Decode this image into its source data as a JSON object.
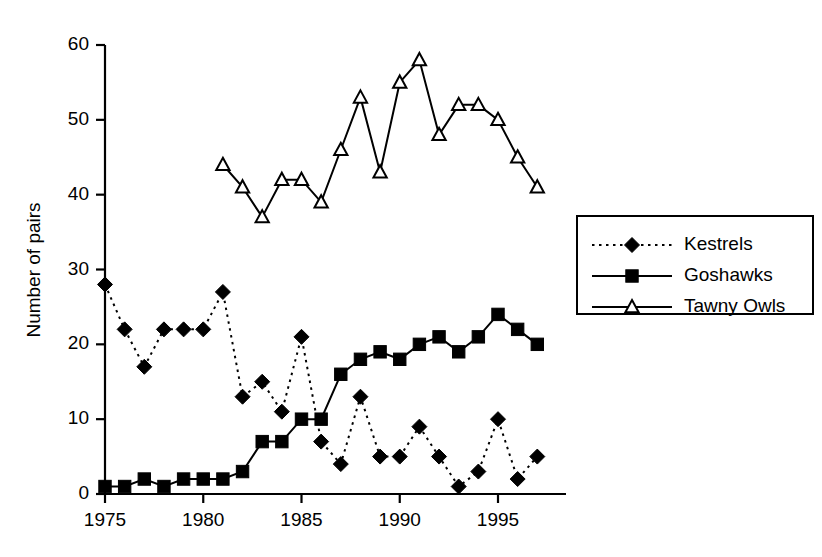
{
  "chart_data": {
    "type": "line",
    "title": "",
    "subtitle": "",
    "xlabel": "",
    "ylabel": "Number of pairs",
    "xlim": [
      1974,
      1998
    ],
    "ylim": [
      0,
      60
    ],
    "xticks": [
      1975,
      1980,
      1985,
      1990,
      1995
    ],
    "yticks": [
      0,
      10,
      20,
      30,
      40,
      50,
      60
    ],
    "grid": false,
    "legend_position": "right",
    "series": [
      {
        "name": "Kestrels",
        "marker": "filled-diamond",
        "linestyle": "dotted",
        "x": [
          1975,
          1976,
          1977,
          1978,
          1979,
          1980,
          1981,
          1982,
          1983,
          1984,
          1985,
          1986,
          1987,
          1988,
          1989,
          1990,
          1991,
          1992,
          1993,
          1994,
          1995,
          1996,
          1997
        ],
        "values": [
          28,
          22,
          17,
          22,
          22,
          22,
          27,
          13,
          15,
          11,
          21,
          7,
          4,
          13,
          5,
          5,
          9,
          5,
          1,
          3,
          10,
          2,
          5
        ]
      },
      {
        "name": "Goshawks",
        "marker": "filled-square",
        "linestyle": "solid",
        "x": [
          1975,
          1976,
          1977,
          1978,
          1979,
          1980,
          1981,
          1982,
          1983,
          1984,
          1985,
          1986,
          1987,
          1988,
          1989,
          1990,
          1991,
          1992,
          1993,
          1994,
          1995,
          1996,
          1997
        ],
        "values": [
          1,
          1,
          2,
          1,
          2,
          2,
          2,
          3,
          7,
          7,
          10,
          10,
          16,
          18,
          19,
          18,
          20,
          21,
          19,
          21,
          24,
          22,
          20
        ]
      },
      {
        "name": "Tawny Owls",
        "marker": "open-triangle",
        "linestyle": "solid",
        "x": [
          1981,
          1982,
          1983,
          1984,
          1985,
          1986,
          1987,
          1988,
          1989,
          1990,
          1991,
          1992,
          1993,
          1994,
          1995,
          1996,
          1997
        ],
        "values": [
          44,
          41,
          37,
          42,
          42,
          39,
          46,
          53,
          43,
          55,
          58,
          48,
          52,
          52,
          50,
          45,
          41
        ]
      }
    ]
  },
  "legend": {
    "entries": [
      {
        "label": "Kestrels"
      },
      {
        "label": "Goshawks"
      },
      {
        "label": "Tawny Owls"
      }
    ]
  },
  "colors": {
    "ink": "#000000",
    "paper": "#ffffff"
  }
}
